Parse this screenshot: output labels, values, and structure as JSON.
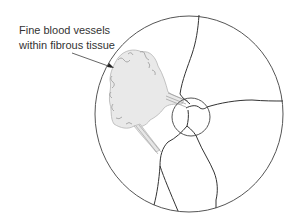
{
  "figure": {
    "annotation": {
      "lines": [
        "Fine blood vessels",
        "within fibrous tissue"
      ]
    },
    "colors": {
      "outline": "#555555",
      "vessel": "#333333",
      "fibrous_tissue_fill": "#e6e6e6",
      "fibrous_tissue_edge": "#aaaaaa",
      "label_text": "#333333",
      "background": "#ffffff"
    }
  }
}
